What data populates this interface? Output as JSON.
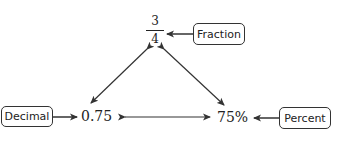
{
  "diagram": {
    "fraction": {
      "numerator": "3",
      "denominator": "4"
    },
    "decimal_value": "0.75",
    "percent_value": "75%",
    "labels": {
      "fraction": "Fraction",
      "decimal": "Decimal",
      "percent": "Percent"
    },
    "colors": {
      "stroke": "#333333",
      "text": "#222222",
      "background": "#ffffff"
    }
  }
}
